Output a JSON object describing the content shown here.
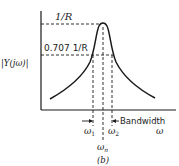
{
  "figure": {
    "caption": "(b)",
    "y_axis_label": "|Y(jω)|",
    "x_axis_label": "ω",
    "peak_label": "1/R",
    "half_power_label": "0.707 1/R",
    "bandwidth_label": "Bandwidth",
    "omega1_label": "ω",
    "omega1_sub": "1",
    "omega2_label": "ω",
    "omega2_sub": "2",
    "omegan_label": "ω",
    "omegan_sub": "n"
  },
  "colors": {
    "ink": "#1a1a1a",
    "background": "#ffffff"
  }
}
